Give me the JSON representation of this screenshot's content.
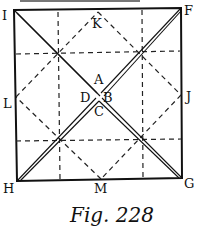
{
  "figure": {
    "caption": "Fig. 228",
    "labels": {
      "I": "I",
      "F": "F",
      "H": "H",
      "G": "G",
      "K": "K",
      "J": "J",
      "L": "L",
      "M": "M",
      "A": "A",
      "B": "B",
      "C": "C",
      "D": "D"
    },
    "colors": {
      "ink": "#111111",
      "paper": "#ffffff"
    }
  }
}
